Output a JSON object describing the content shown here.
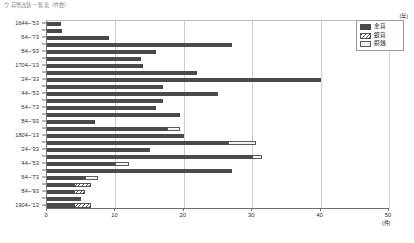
{
  "caption": "ウ 貨幣改鋳 一覧表（件数）",
  "legend": {
    "position": "top-right",
    "items": [
      {
        "label": "金貨",
        "key": "kin",
        "pattern": "solid",
        "color": "#4a4a4a"
      },
      {
        "label": "銀貨",
        "key": "gin",
        "pattern": "diagonal-hatch",
        "color": "#ffffff"
      },
      {
        "label": "銅銭",
        "key": "sen",
        "pattern": "outline",
        "color": "#f2f2f2"
      }
    ]
  },
  "axes": {
    "y_unit": "(年)",
    "x_unit": "(件)",
    "x_ticks": [
      0,
      10,
      20,
      30,
      40,
      50
    ],
    "xlim": [
      0,
      50
    ],
    "grid": "vertical"
  },
  "chart_data": {
    "type": "bar",
    "orientation": "horizontal",
    "stacked": true,
    "title": "ウ 貨幣改鋳 一覧表（件数）",
    "xlabel": "(件)",
    "ylabel": "(年)",
    "xlim": [
      0,
      50
    ],
    "x_ticks": [
      0,
      10,
      20,
      30,
      40,
      50
    ],
    "grid": true,
    "legend_position": "top-right",
    "categories": [
      "1644~'53",
      "'54~'63",
      "'64~'73",
      "'74~'83",
      "'84~'93",
      "'94~1703",
      "1704~'13",
      "'14~'23",
      "'24~'33",
      "'34~'43",
      "'44~'53",
      "'54~'63",
      "'64~'73",
      "'74~'83",
      "'84~'93",
      "'94~1803",
      "1804~'13",
      "'14~'23",
      "'24~'33",
      "'34~'43",
      "'44~'53",
      "'54~'63",
      "'64~'73",
      "'74~'83",
      "'84~'93",
      "'94~1903",
      "1904~'13"
    ],
    "series": [
      {
        "name": "金貨",
        "key": "kin",
        "values": [
          2.0,
          2.2,
          9.0,
          27.0,
          16.0,
          13.8,
          14.0,
          22.0,
          40.0,
          17.0,
          25.0,
          17.0,
          16.0,
          19.5,
          7.0,
          17.5,
          20.0,
          26.5,
          15.0,
          30.0,
          10.0,
          27.0,
          5.5,
          4.0,
          4.0,
          5.0,
          4.0
        ]
      },
      {
        "name": "銀貨",
        "key": "gin",
        "values": [
          0,
          0,
          0,
          0,
          0,
          0,
          0,
          0,
          0,
          0,
          0,
          0,
          0,
          0,
          0,
          0,
          0,
          0,
          0,
          0,
          0,
          0,
          0,
          2.5,
          1.5,
          0,
          2.5
        ]
      },
      {
        "name": "銅銭",
        "key": "sen",
        "values": [
          0,
          0,
          0,
          0,
          0,
          0,
          0,
          0,
          0,
          0,
          0,
          0,
          0,
          0,
          0,
          2.0,
          0,
          4.0,
          0,
          1.5,
          2.0,
          0,
          2.0,
          0,
          0,
          0,
          0
        ]
      }
    ]
  }
}
